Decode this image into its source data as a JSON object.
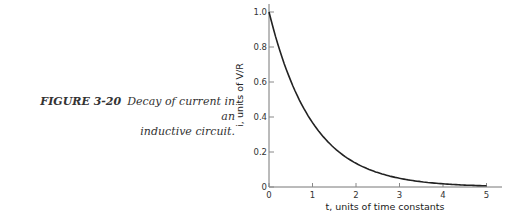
{
  "caption": {
    "figure_label": "FIGURE 3-20",
    "text_line1": "Decay of current in an",
    "text_line2": "inductive circuit."
  },
  "chart_data": {
    "type": "line",
    "title": "",
    "xlabel": "t, units of time constants",
    "ylabel": "i, units of V/R",
    "xlim": [
      0,
      5.3
    ],
    "ylim": [
      0,
      1.05
    ],
    "x_ticks": [
      "0",
      "1",
      "2",
      "3",
      "4",
      "5"
    ],
    "y_ticks": [
      "0",
      "0.2",
      "0.4",
      "0.6",
      "0.8",
      "1.0"
    ],
    "grid": false,
    "legend": null,
    "series": [
      {
        "name": "i = e^(-t)",
        "x": [
          0,
          0.5,
          1,
          1.5,
          2,
          2.5,
          3,
          3.5,
          4,
          4.5,
          5
        ],
        "y": [
          1.0,
          0.607,
          0.368,
          0.223,
          0.135,
          0.082,
          0.05,
          0.03,
          0.018,
          0.011,
          0.007
        ]
      }
    ]
  }
}
